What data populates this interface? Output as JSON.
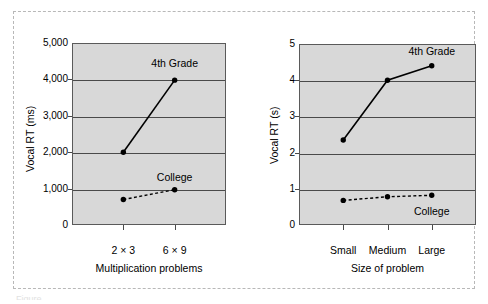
{
  "figure": {
    "caption_fragment": "Figure",
    "border_color": "#b8b8b8",
    "plot_background": "#d8d8d8",
    "gridline_color": "#4a4a4a",
    "series_color": "#000000"
  },
  "chart_data": [
    {
      "type": "line",
      "panel": "left",
      "title": "",
      "xlabel": "Multiplication problems",
      "ylabel": "Vocal RT (ms)",
      "categories": [
        "2 × 3",
        "6 × 9"
      ],
      "yticks": [
        "0",
        "1,000",
        "2,000",
        "3,000",
        "4,000",
        "5,000"
      ],
      "ytick_values": [
        0,
        1000,
        2000,
        3000,
        4000,
        5000
      ],
      "ylim": [
        0,
        5000
      ],
      "grid": true,
      "legend": "inline-annotation",
      "series": [
        {
          "name": "4th Grade",
          "values": [
            2000,
            3980
          ],
          "linestyle": "solid",
          "marker": "filled-circle",
          "label_x_category": "6 × 9",
          "label_y": 4450
        },
        {
          "name": "College",
          "values": [
            700,
            970
          ],
          "linestyle": "dashed",
          "marker": "filled-circle",
          "label_x_category": "6 × 9",
          "label_y": 1330
        }
      ]
    },
    {
      "type": "line",
      "panel": "right",
      "title": "",
      "xlabel": "Size of problem",
      "ylabel": "Vocal RT (s)",
      "categories": [
        "Small",
        "Medium",
        "Large"
      ],
      "yticks": [
        "0",
        "1",
        "2",
        "3",
        "4",
        "5"
      ],
      "ytick_values": [
        0,
        1,
        2,
        3,
        4,
        5
      ],
      "ylim": [
        0,
        5
      ],
      "grid": true,
      "legend": "inline-annotation",
      "series": [
        {
          "name": "4th Grade",
          "values": [
            2.35,
            4.0,
            4.4
          ],
          "linestyle": "solid",
          "marker": "filled-circle",
          "label_x_category": "Large",
          "label_y": 4.82
        },
        {
          "name": "College",
          "values": [
            0.68,
            0.78,
            0.82
          ],
          "linestyle": "dashed",
          "marker": "filled-circle",
          "label_x_category": "Large",
          "label_y": 0.38
        }
      ]
    }
  ]
}
